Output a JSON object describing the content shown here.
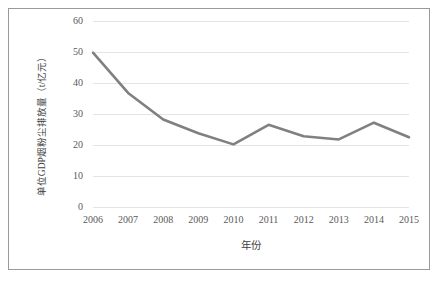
{
  "figure": {
    "border_color": "#9a9a9a",
    "background": "#ffffff"
  },
  "chart_data": {
    "type": "line",
    "title": "",
    "xlabel": "年份",
    "ylabel": "单位GDP烟粉尘排放量（t/亿元）",
    "categories": [
      "2006",
      "2007",
      "2008",
      "2009",
      "2010",
      "2011",
      "2012",
      "2013",
      "2014",
      "2015"
    ],
    "x": [
      2006,
      2007,
      2008,
      2009,
      2010,
      2011,
      2012,
      2013,
      2014,
      2015
    ],
    "values": [
      49.8,
      36.8,
      28.2,
      23.8,
      20.2,
      26.5,
      22.8,
      21.8,
      27.2,
      22.5
    ],
    "series": [
      {
        "name": "单位GDP烟粉尘排放量",
        "values": [
          49.8,
          36.8,
          28.2,
          23.8,
          20.2,
          26.5,
          22.8,
          21.8,
          27.2,
          22.5
        ],
        "color": "#808080"
      }
    ],
    "ylim": [
      0,
      60
    ],
    "yticks": [
      0,
      10,
      20,
      30,
      40,
      50,
      60
    ],
    "ytick_labels": [
      "0",
      "10",
      "20",
      "30",
      "40",
      "50",
      "60"
    ],
    "xlim": [
      2006,
      2015
    ],
    "grid": true,
    "grid_axis": "y",
    "grid_color": "#e4e4e4",
    "legend": false,
    "legend_position": "none",
    "line_width": 2.6,
    "markers": "none",
    "line_color": "#808080",
    "axis_label_color": "#595959"
  }
}
